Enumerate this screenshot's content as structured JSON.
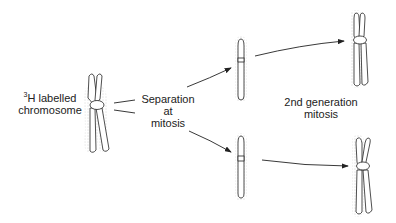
{
  "labels": {
    "start": {
      "superscript": "3",
      "line1": "H labelled",
      "line2": "chromosome"
    },
    "separation": {
      "line1": "Separation",
      "line2": "at",
      "line3": "mitosis"
    },
    "second_gen": {
      "line1": "2nd generation",
      "line2": "mitosis"
    }
  },
  "stages": [
    {
      "name": "parent-chromosome",
      "type": "two-chromatid",
      "labelled_chromatids": 2
    },
    {
      "name": "daughter-chromosome-top",
      "type": "single-chromatid",
      "labelled": true
    },
    {
      "name": "daughter-chromosome-bottom",
      "type": "single-chromatid",
      "labelled": true
    },
    {
      "name": "second-gen-chromosome-top",
      "type": "two-chromatid",
      "labelled_chromatids": 1
    },
    {
      "name": "second-gen-chromosome-bottom",
      "type": "two-chromatid",
      "labelled_chromatids": 1
    }
  ],
  "colors": {
    "stroke": "#222222",
    "label_dots": "#888888"
  }
}
